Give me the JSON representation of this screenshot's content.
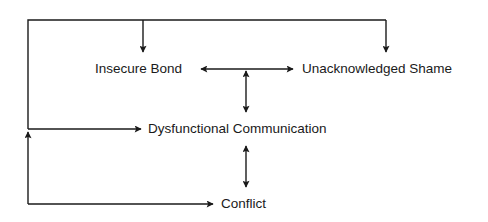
{
  "diagram": {
    "type": "flow",
    "nodes": [
      {
        "id": "insecure_bond",
        "label": "Insecure Bond"
      },
      {
        "id": "unacknowledged_shame",
        "label": "Unacknowledged Shame"
      },
      {
        "id": "dysfunctional_communication",
        "label": "Dysfunctional Communication"
      },
      {
        "id": "conflict",
        "label": "Conflict"
      }
    ],
    "edges": [
      {
        "from": "insecure_bond",
        "to": "unacknowledged_shame",
        "bidirectional": true
      },
      {
        "from": "insecure_bond-unacknowledged_shame",
        "to": "dysfunctional_communication",
        "bidirectional": true
      },
      {
        "from": "dysfunctional_communication",
        "to": "conflict",
        "bidirectional": true
      },
      {
        "from": "conflict",
        "to": "dysfunctional_communication",
        "bidirectional": false,
        "route": "feedback-loop-left"
      },
      {
        "from": "dysfunctional_communication",
        "to": "insecure_bond",
        "bidirectional": false,
        "route": "feedback-loop-top"
      },
      {
        "from": "dysfunctional_communication",
        "to": "unacknowledged_shame",
        "bidirectional": false,
        "route": "feedback-loop-top"
      }
    ],
    "colors": {
      "line": "#1a1a1a",
      "background": "#ffffff"
    }
  }
}
